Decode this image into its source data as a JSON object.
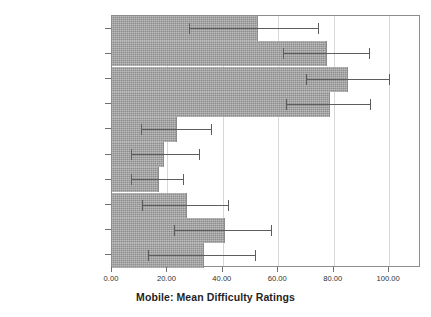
{
  "chart_data": {
    "type": "bar",
    "orientation": "horizontal",
    "title": "Mobile: Mean Difficulty Ratings",
    "xlabel": "Mobile: Mean Difficulty Ratings",
    "ylabel": "",
    "xlim": [
      0,
      111.5
    ],
    "xticks": [
      0,
      20,
      40,
      60,
      80,
      100
    ],
    "xticklabels": [
      "0.00",
      "20.00",
      "40.00",
      "60.00",
      "80.00",
      "100.00"
    ],
    "grid": "vertical",
    "legend": "none",
    "bar_color": "#a2a2a2",
    "error_color": "#5d5d5d",
    "categories": [
      "MFrustrationRating",
      "MDiffMentalDemandOverall",
      "MDiffNextAction",
      "MDiffStartTask",
      "MDiffPhysicalDemandOverall",
      "MDiffPressButtons",
      "MDiffGraspPhone",
      "MDiffSeeScreenText",
      "MDiffSeeButtonText",
      "MDiffSeeButtons"
    ],
    "values": [
      52.7,
      77.6,
      85.2,
      78.7,
      23.5,
      18.8,
      17.0,
      27.0,
      40.8,
      33.2
    ],
    "error_low": [
      27.8,
      61.7,
      69.9,
      62.7,
      10.5,
      6.8,
      6.9,
      11.0,
      22.4,
      13.0
    ],
    "error_high": [
      74.4,
      92.8,
      100.0,
      93.0,
      35.7,
      31.5,
      25.8,
      42.0,
      57.4,
      51.5
    ],
    "bars": [
      {
        "category": "MFrustrationRating",
        "value": 52.7,
        "err_low": 27.8,
        "err_high": 74.4
      },
      {
        "category": "MDiffMentalDemandOverall",
        "value": 77.6,
        "err_low": 61.7,
        "err_high": 92.8
      },
      {
        "category": "MDiffNextAction",
        "value": 85.2,
        "err_low": 69.9,
        "err_high": 100.0
      },
      {
        "category": "MDiffStartTask",
        "value": 78.7,
        "err_low": 62.7,
        "err_high": 93.0
      },
      {
        "category": "MDiffPhysicalDemandOverall",
        "value": 23.5,
        "err_low": 10.5,
        "err_high": 35.7
      },
      {
        "category": "MDiffPressButtons",
        "value": 18.8,
        "err_low": 6.8,
        "err_high": 31.5
      },
      {
        "category": "MDiffGraspPhone",
        "value": 17.0,
        "err_low": 6.9,
        "err_high": 25.8
      },
      {
        "category": "MDiffSeeScreenText",
        "value": 27.0,
        "err_low": 11.0,
        "err_high": 42.0
      },
      {
        "category": "MDiffSeeButtonText",
        "value": 40.8,
        "err_low": 22.4,
        "err_high": 57.4
      },
      {
        "category": "MDiffSeeButtons",
        "value": 33.2,
        "err_low": 13.0,
        "err_high": 51.5
      }
    ]
  }
}
